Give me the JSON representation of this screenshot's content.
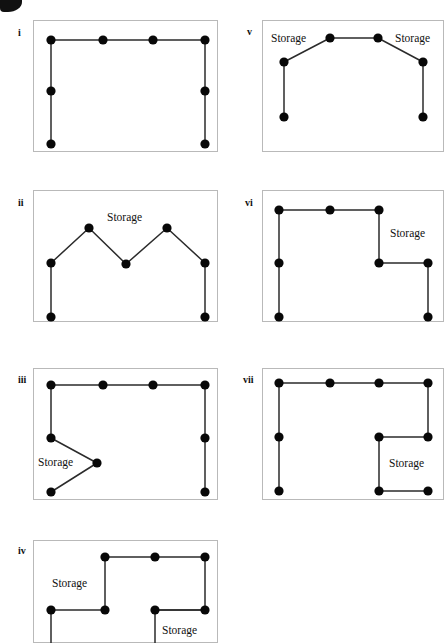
{
  "figure": {
    "corner_mark": "partial-black-glyph",
    "storage_label": "Storage",
    "node_color": "#080808",
    "edge_color": "#2b2b2b",
    "box_border_color": "#b9b9b9",
    "background": "#ffffff",
    "panels": [
      {
        "id": "i",
        "numeral": "i",
        "numeral_pos": [
          18,
          28
        ],
        "box": [
          33,
          20,
          185,
          132
        ],
        "edges": [
          [
            [
              51,
              40
            ],
            [
              103,
              40
            ],
            [
              153,
              40
            ],
            [
              205,
              40
            ]
          ],
          [
            [
              51,
              40
            ],
            [
              51,
              91
            ],
            [
              51,
              144
            ]
          ],
          [
            [
              205,
              40
            ],
            [
              205,
              91
            ],
            [
              205,
              144
            ]
          ]
        ],
        "nodes": [
          [
            51,
            40
          ],
          [
            103,
            40
          ],
          [
            153,
            40
          ],
          [
            205,
            40
          ],
          [
            51,
            91
          ],
          [
            51,
            144
          ],
          [
            205,
            91
          ],
          [
            205,
            144
          ]
        ],
        "labels": []
      },
      {
        "id": "v",
        "numeral": "v",
        "numeral_pos": [
          247,
          27
        ],
        "box": [
          262,
          20,
          182,
          132
        ],
        "edges": [
          [
            [
              284,
              62
            ],
            [
              330,
              38
            ],
            [
              378,
              38
            ],
            [
              423,
              62
            ]
          ],
          [
            [
              284,
              62
            ],
            [
              284,
              117
            ]
          ],
          [
            [
              423,
              62
            ],
            [
              423,
              117
            ]
          ]
        ],
        "nodes": [
          [
            330,
            38
          ],
          [
            378,
            38
          ],
          [
            284,
            62
          ],
          [
            423,
            62
          ],
          [
            284,
            117
          ],
          [
            423,
            117
          ]
        ],
        "labels": [
          {
            "text": "Storage",
            "pos": [
              271,
              33
            ]
          },
          {
            "text": "Storage",
            "pos": [
              395,
              33
            ]
          }
        ]
      },
      {
        "id": "ii",
        "numeral": "ii",
        "numeral_pos": [
          18,
          198
        ],
        "box": [
          33,
          190,
          185,
          132
        ],
        "edges": [
          [
            [
              51,
              263
            ],
            [
              89,
              228
            ],
            [
              126,
              264
            ],
            [
              167,
              228
            ],
            [
              205,
              263
            ]
          ],
          [
            [
              51,
              263
            ],
            [
              51,
              317
            ]
          ],
          [
            [
              205,
              263
            ],
            [
              205,
              317
            ]
          ]
        ],
        "nodes": [
          [
            51,
            263
          ],
          [
            89,
            228
          ],
          [
            126,
            264
          ],
          [
            167,
            228
          ],
          [
            205,
            263
          ],
          [
            51,
            317
          ],
          [
            205,
            317
          ]
        ],
        "labels": [
          {
            "text": "Storage",
            "pos": [
              107,
              212
            ]
          }
        ]
      },
      {
        "id": "vi",
        "numeral": "vi",
        "numeral_pos": [
          245,
          198
        ],
        "box": [
          262,
          190,
          182,
          132
        ],
        "edges": [
          [
            [
              279,
              210
            ],
            [
              330,
              210
            ],
            [
              379,
              210
            ]
          ],
          [
            [
              279,
              210
            ],
            [
              279,
              263
            ],
            [
              279,
              317
            ]
          ],
          [
            [
              379,
              210
            ],
            [
              379,
              263
            ],
            [
              428,
              263
            ],
            [
              428,
              317
            ]
          ]
        ],
        "nodes": [
          [
            279,
            210
          ],
          [
            330,
            210
          ],
          [
            379,
            210
          ],
          [
            279,
            263
          ],
          [
            279,
            317
          ],
          [
            379,
            263
          ],
          [
            428,
            263
          ],
          [
            428,
            317
          ]
        ],
        "labels": [
          {
            "text": "Storage",
            "pos": [
              390,
              228
            ]
          }
        ]
      },
      {
        "id": "iii",
        "numeral": "iii",
        "numeral_pos": [
          18,
          375
        ],
        "box": [
          33,
          368,
          185,
          132
        ],
        "edges": [
          [
            [
              51,
              385
            ],
            [
              103,
              385
            ],
            [
              153,
              385
            ],
            [
              205,
              385
            ]
          ],
          [
            [
              51,
              385
            ],
            [
              51,
              438
            ],
            [
              97,
              463
            ],
            [
              51,
              492
            ]
          ],
          [
            [
              205,
              385
            ],
            [
              205,
              438
            ],
            [
              205,
              492
            ]
          ]
        ],
        "nodes": [
          [
            51,
            385
          ],
          [
            103,
            385
          ],
          [
            153,
            385
          ],
          [
            205,
            385
          ],
          [
            51,
            438
          ],
          [
            97,
            463
          ],
          [
            51,
            492
          ],
          [
            205,
            438
          ],
          [
            205,
            492
          ]
        ],
        "labels": [
          {
            "text": "Storage",
            "pos": [
              38,
              457
            ]
          }
        ]
      },
      {
        "id": "vii",
        "numeral": "vii",
        "numeral_pos": [
          243,
          375
        ],
        "box": [
          262,
          368,
          182,
          132
        ],
        "edges": [
          [
            [
              279,
              383
            ],
            [
              330,
              383
            ],
            [
              379,
              383
            ],
            [
              428,
              383
            ]
          ],
          [
            [
              279,
              383
            ],
            [
              279,
              437
            ],
            [
              279,
              491
            ]
          ],
          [
            [
              428,
              383
            ],
            [
              428,
              437
            ],
            [
              379,
              437
            ],
            [
              379,
              491
            ],
            [
              428,
              491
            ]
          ]
        ],
        "nodes": [
          [
            279,
            383
          ],
          [
            330,
            383
          ],
          [
            379,
            383
          ],
          [
            428,
            383
          ],
          [
            279,
            437
          ],
          [
            279,
            491
          ],
          [
            428,
            437
          ],
          [
            379,
            437
          ],
          [
            379,
            491
          ],
          [
            428,
            491
          ]
        ],
        "labels": [
          {
            "text": "Storage",
            "pos": [
              389,
              458
            ]
          }
        ]
      },
      {
        "id": "iv",
        "numeral": "iv",
        "numeral_pos": [
          18,
          546
        ],
        "box": [
          33,
          540,
          185,
          103
        ],
        "edges": [
          [
            [
              105,
              557
            ],
            [
              155,
              557
            ],
            [
              205,
              557
            ]
          ],
          [
            [
              105,
              557
            ],
            [
              105,
              610
            ],
            [
              51,
              610
            ],
            [
              51,
              645
            ]
          ],
          [
            [
              205,
              557
            ],
            [
              205,
              610
            ],
            [
              155,
              610
            ],
            [
              155,
              645
            ]
          ],
          [
            [
              155,
              610
            ],
            [
              205,
              610
            ]
          ]
        ],
        "nodes": [
          [
            105,
            557
          ],
          [
            155,
            557
          ],
          [
            205,
            557
          ],
          [
            105,
            610
          ],
          [
            51,
            610
          ],
          [
            155,
            610
          ],
          [
            205,
            610
          ]
        ],
        "labels": [
          {
            "text": "Storage",
            "pos": [
              52,
              578
            ]
          },
          {
            "text": "Storage",
            "pos": [
              162,
              625
            ]
          }
        ]
      }
    ]
  }
}
